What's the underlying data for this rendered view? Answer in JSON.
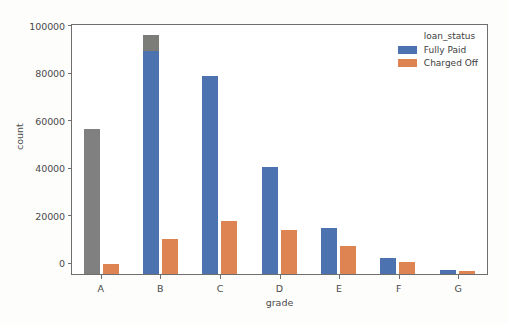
{
  "chart_data": {
    "type": "bar",
    "title": "",
    "xlabel": "grade",
    "ylabel": "count",
    "categories": [
      "A",
      "B",
      "C",
      "D",
      "E",
      "F",
      "G"
    ],
    "series": [
      {
        "name": "Fully Paid",
        "color": "#4c72b0",
        "values": [
          61000,
          101000,
          83600,
          45000,
          19500,
          6800,
          1500
        ]
      },
      {
        "name": "Charged Off",
        "color": "#dd8452",
        "values": [
          4100,
          14800,
          22200,
          18700,
          11800,
          5000,
          1400
        ]
      }
    ],
    "ylim": [
      0,
      105000
    ],
    "yticks": [
      "0",
      "20000",
      "40000",
      "60000",
      "80000",
      "100000"
    ],
    "ytick_values": [
      0,
      20000,
      40000,
      60000,
      80000,
      100000
    ],
    "grid": false,
    "legend": {
      "title": "loan_status",
      "position": "upper right",
      "entries": [
        {
          "label": "Fully Paid",
          "color": "#4c72b0"
        },
        {
          "label": "Charged Off",
          "color": "#dd8452"
        }
      ]
    },
    "render_artifacts": {
      "note": "grade A Fully Paid bar renders gray; grade B Fully Paid bar has gray cap above 94000",
      "artifact_color": "#808080",
      "b_cap_from": 94000
    }
  }
}
